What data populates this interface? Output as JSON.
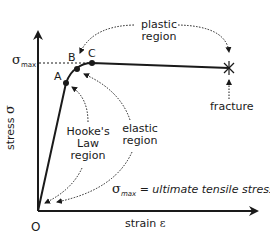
{
  "diagram": {
    "axes": {
      "x_label": "strain",
      "x_symbol": "ε",
      "y_label": "stress",
      "y_symbol": "σ",
      "origin_label": "O"
    },
    "sigma_max": {
      "symbol": "σ",
      "subscript": "max"
    },
    "points": [
      {
        "id": "A",
        "label": "A"
      },
      {
        "id": "B",
        "label": "B"
      },
      {
        "id": "C",
        "label": "C"
      }
    ],
    "regions": {
      "plastic": {
        "line1": "plastic",
        "line2": "region"
      },
      "elastic": {
        "line1": "elastic",
        "line2": "region"
      },
      "hookes_law": {
        "line1": "Hooke's",
        "line2": "Law",
        "line3": "region"
      }
    },
    "fracture_label": "fracture",
    "definition": {
      "symbol": "σ",
      "subscript": "max",
      "text": " = ultimate tensile stress"
    },
    "colors": {
      "line": "#1a1a1a",
      "background": "#ffffff"
    }
  }
}
